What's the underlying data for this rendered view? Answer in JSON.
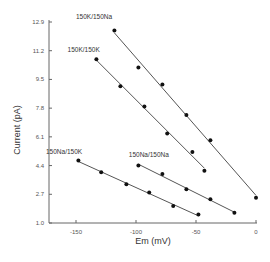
{
  "chart_data": {
    "type": "scatter",
    "title": "",
    "xlabel": "Em (mV)",
    "ylabel": "Current (pA)",
    "xlim": [
      -175,
      0
    ],
    "ylim": [
      1.0,
      12.9
    ],
    "x_ticks": [
      -150,
      -100,
      -50,
      0
    ],
    "x_tick_labels": [
      "-150",
      "-100",
      "-50",
      "0"
    ],
    "y_ticks": [
      1.0,
      2.7,
      4.4,
      6.1,
      7.8,
      9.5,
      11.2,
      12.9
    ],
    "y_tick_labels": [
      "1.0",
      "2.7",
      "4.4",
      "6.1",
      "7.8",
      "9.5",
      "11.2",
      "12.9"
    ],
    "grid": false,
    "legend": "inline labels",
    "fit_lines": true,
    "series": [
      {
        "name": "150K/150Na",
        "label_pos": [
          -150,
          13.1
        ],
        "x": [
          -118,
          -98,
          -78,
          -58,
          -38,
          0
        ],
        "y": [
          12.4,
          10.2,
          9.2,
          7.4,
          5.9,
          2.5
        ]
      },
      {
        "name": "150K/150K",
        "label_pos": [
          -157,
          11.1
        ],
        "x": [
          -133,
          -113,
          -93,
          -74,
          -53,
          -43
        ],
        "y": [
          10.7,
          9.1,
          7.9,
          6.3,
          5.2,
          4.1
        ]
      },
      {
        "name": "150Na/150K",
        "label_pos": [
          -175,
          5.1
        ],
        "x": [
          -148,
          -129,
          -108,
          -89,
          -69,
          -48
        ],
        "y": [
          4.7,
          4.0,
          3.3,
          2.8,
          2.0,
          1.5
        ]
      },
      {
        "name": "150Na/150Na",
        "label_pos": [
          -106,
          4.9
        ],
        "x": [
          -98,
          -78,
          -58,
          -38,
          -18
        ],
        "y": [
          4.4,
          3.9,
          3.0,
          2.4,
          1.6
        ]
      }
    ]
  },
  "colors": {
    "background": "#ffffff",
    "points": "#111111",
    "lines": "#555555",
    "axis": "#666666"
  }
}
